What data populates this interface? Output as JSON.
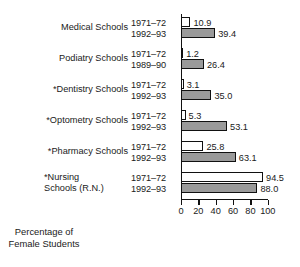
{
  "chart_data": {
    "type": "bar",
    "orientation": "horizontal",
    "title": "",
    "xlabel": "Percentage of\nFemale Students",
    "ylabel": "",
    "xlim": [
      0,
      100
    ],
    "grid": false,
    "legend": false,
    "xticks": [
      0,
      20,
      40,
      60,
      80,
      100
    ],
    "xtick_labels": [
      "0",
      "20",
      "40",
      "60",
      "80",
      "100"
    ],
    "categories": [
      "Medical Schools",
      "Podiatry Schools",
      "*Dentistry Schools",
      "*Optometry Schools",
      "*Pharmacy Schools",
      "*Nursing\n Schools (R.N.)"
    ],
    "groups": [
      {
        "category": "Medical Schools",
        "bars": [
          {
            "period": "1971–72",
            "value": 10.9,
            "label": "10.9",
            "style": "light"
          },
          {
            "period": "1992–93",
            "value": 39.4,
            "label": "39.4",
            "style": "dark"
          }
        ]
      },
      {
        "category": "Podiatry Schools",
        "bars": [
          {
            "period": "1971–72",
            "value": 1.2,
            "label": "1.2",
            "style": "light"
          },
          {
            "period": "1989–90",
            "value": 26.4,
            "label": "26.4",
            "style": "dark"
          }
        ]
      },
      {
        "category": "*Dentistry Schools",
        "bars": [
          {
            "period": "1971–72",
            "value": 3.1,
            "label": "3.1",
            "style": "light"
          },
          {
            "period": "1992–93",
            "value": 35.0,
            "label": "35.0",
            "style": "dark"
          }
        ]
      },
      {
        "category": "*Optometry Schools",
        "bars": [
          {
            "period": "1971–72",
            "value": 5.3,
            "label": "5.3",
            "style": "light"
          },
          {
            "period": "1992–93",
            "value": 53.1,
            "label": "53.1",
            "style": "dark"
          }
        ]
      },
      {
        "category": "*Pharmacy Schools",
        "bars": [
          {
            "period": "1971–72",
            "value": 25.8,
            "label": "25.8",
            "style": "light"
          },
          {
            "period": "1992–93",
            "value": 63.1,
            "label": "63.1",
            "style": "dark"
          }
        ]
      },
      {
        "category": "*Nursing\n Schools (R.N.)",
        "bars": [
          {
            "period": "1971–72",
            "value": 94.5,
            "label": "94.5",
            "style": "light"
          },
          {
            "period": "1992–93",
            "value": 88.0,
            "label": "88.0",
            "style": "dark"
          }
        ]
      }
    ],
    "colors": {
      "light_bar_fill": "#ffffff",
      "dark_bar_fill": "#9a9a9a",
      "bar_border": "#111111",
      "axis": "#111111",
      "text": "#1a1a1a",
      "background": "#ffffff"
    }
  }
}
